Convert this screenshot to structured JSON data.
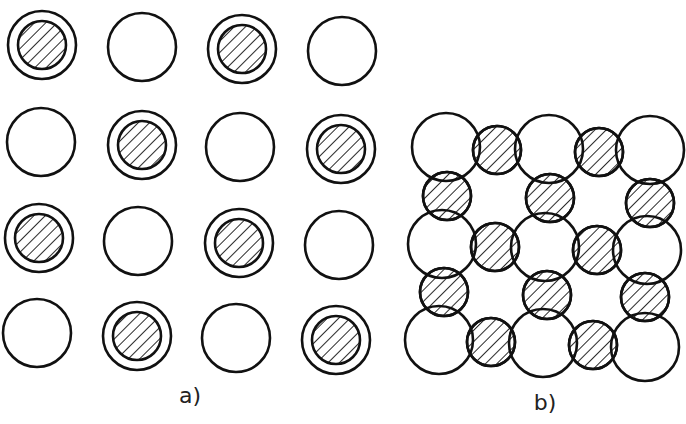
{
  "figure": {
    "colors": {
      "stroke": "#111111",
      "background": "#ffffff",
      "hatch": "#111111"
    },
    "panel_a": {
      "label": "a)",
      "label_pos": [
        190,
        403
      ],
      "outer_radius": 34,
      "inner_radius": 24,
      "sites": [
        {
          "x": 42,
          "y": 45,
          "occupied": true
        },
        {
          "x": 142,
          "y": 47,
          "occupied": false
        },
        {
          "x": 242,
          "y": 49,
          "occupied": true
        },
        {
          "x": 342,
          "y": 51,
          "occupied": false
        },
        {
          "x": 41,
          "y": 142,
          "occupied": false
        },
        {
          "x": 142,
          "y": 145,
          "occupied": true
        },
        {
          "x": 240,
          "y": 147,
          "occupied": false
        },
        {
          "x": 341,
          "y": 149,
          "occupied": true
        },
        {
          "x": 39,
          "y": 238,
          "occupied": true
        },
        {
          "x": 138,
          "y": 241,
          "occupied": false
        },
        {
          "x": 239,
          "y": 243,
          "occupied": true
        },
        {
          "x": 339,
          "y": 245,
          "occupied": false
        },
        {
          "x": 37,
          "y": 333,
          "occupied": false
        },
        {
          "x": 137,
          "y": 336,
          "occupied": true
        },
        {
          "x": 236,
          "y": 338,
          "occupied": false
        },
        {
          "x": 336,
          "y": 340,
          "occupied": true
        }
      ]
    },
    "panel_b": {
      "label": "b)",
      "label_pos": [
        545,
        410
      ],
      "large_radius": 34,
      "small_radius": 24,
      "large_circles": [
        {
          "x": 446,
          "y": 147
        },
        {
          "x": 549,
          "y": 149
        },
        {
          "x": 650,
          "y": 150
        },
        {
          "x": 442,
          "y": 244
        },
        {
          "x": 545,
          "y": 247
        },
        {
          "x": 647,
          "y": 250
        },
        {
          "x": 439,
          "y": 340
        },
        {
          "x": 543,
          "y": 343
        },
        {
          "x": 645,
          "y": 347
        }
      ],
      "hatched_circles": [
        {
          "x": 497,
          "y": 150
        },
        {
          "x": 599,
          "y": 152
        },
        {
          "x": 447,
          "y": 196
        },
        {
          "x": 550,
          "y": 198
        },
        {
          "x": 650,
          "y": 203
        },
        {
          "x": 495,
          "y": 247
        },
        {
          "x": 597,
          "y": 250
        },
        {
          "x": 444,
          "y": 292
        },
        {
          "x": 547,
          "y": 295
        },
        {
          "x": 645,
          "y": 297
        },
        {
          "x": 491,
          "y": 342
        },
        {
          "x": 593,
          "y": 345
        }
      ]
    }
  }
}
